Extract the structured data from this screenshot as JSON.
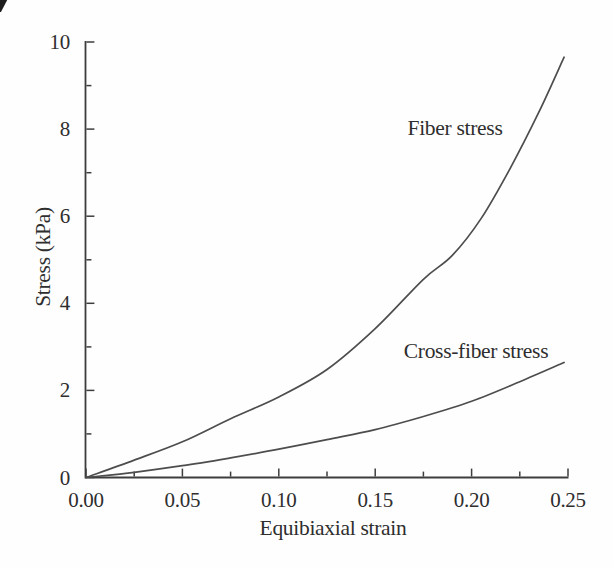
{
  "chart_data": {
    "type": "line",
    "title": "",
    "xlabel": "Equibiaxial strain",
    "ylabel": "Stress (kPa)",
    "xlim": [
      0,
      0.25
    ],
    "ylim": [
      0,
      10
    ],
    "grid": false,
    "legend_position": "inline text annotations next to each curve",
    "x_tick_values": [
      0,
      0.05,
      0.1,
      0.15,
      0.2,
      0.25
    ],
    "x_tick_labels": [
      "0.00",
      "0.05",
      "0.10",
      "0.15",
      "0.20",
      "0.25"
    ],
    "x_minor_tick_step": 0.025,
    "y_tick_values": [
      0,
      2,
      4,
      6,
      8,
      10
    ],
    "y_tick_labels": [
      "0",
      "2",
      "4",
      "6",
      "8",
      "10"
    ],
    "y_minor_tick_step": 1,
    "series": [
      {
        "name": "Fiber stress",
        "x": [
          0,
          0.025,
          0.05,
          0.075,
          0.1,
          0.125,
          0.15,
          0.175,
          0.19,
          0.205,
          0.22,
          0.235,
          0.248
        ],
        "y": [
          0,
          0.4,
          0.82,
          1.35,
          1.85,
          2.48,
          3.42,
          4.55,
          5.1,
          5.95,
          7.1,
          8.4,
          9.65
        ]
      },
      {
        "name": "Cross-fiber stress",
        "x": [
          0,
          0.025,
          0.05,
          0.075,
          0.1,
          0.125,
          0.15,
          0.175,
          0.2,
          0.225,
          0.248
        ],
        "y": [
          0,
          0.12,
          0.27,
          0.45,
          0.65,
          0.87,
          1.1,
          1.4,
          1.75,
          2.2,
          2.64
        ]
      }
    ],
    "colors": {
      "axis": "#3d3d3d",
      "curve": "#4d4d4d",
      "text": "#2e2e2e",
      "background": "#fefefe"
    }
  }
}
